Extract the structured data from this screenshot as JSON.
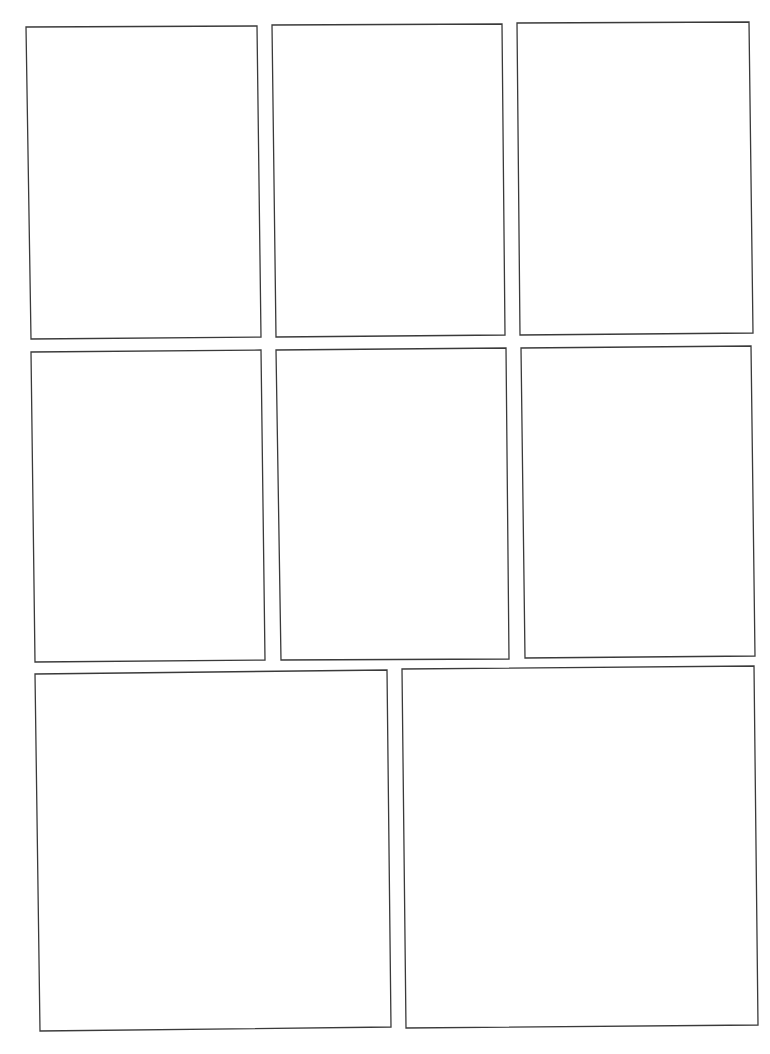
{
  "page": {
    "type": "comic-page-layout",
    "background": "#ffffff",
    "border_color": "#3a3a3a",
    "panel_count": 8,
    "rows": [
      {
        "row": 1,
        "panels": [
          1,
          2,
          3
        ]
      },
      {
        "row": 2,
        "panels": [
          4,
          5,
          6
        ]
      },
      {
        "row": 3,
        "panels": [
          7,
          8
        ]
      }
    ]
  },
  "panels": [
    {
      "id": 1,
      "points": "26,27 257,26 261,337 31,339"
    },
    {
      "id": 2,
      "points": "272,25 502,24 505,335 276,337"
    },
    {
      "id": 3,
      "points": "517,23 749,22 753,333 520,335"
    },
    {
      "id": 4,
      "points": "31,352 261,350 265,660 35,662"
    },
    {
      "id": 5,
      "points": "276,350 506,348 509,659 281,660"
    },
    {
      "id": 6,
      "points": "521,348 751,346 755,656 525,658"
    },
    {
      "id": 7,
      "points": "35,674 387,670 391,1027 40,1031"
    },
    {
      "id": 8,
      "points": "402,669 754,666 758,1025 406,1028"
    }
  ]
}
